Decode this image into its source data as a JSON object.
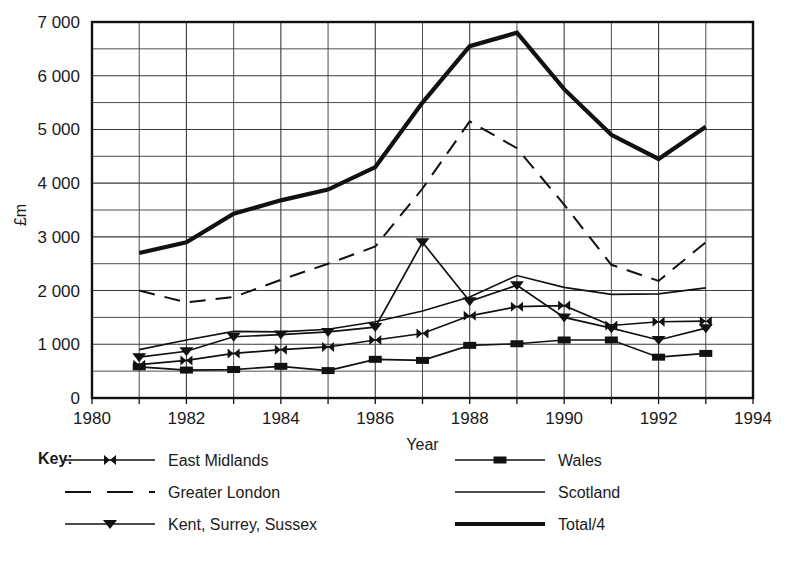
{
  "chart_data": {
    "type": "line",
    "title": "",
    "xlabel": "Year",
    "ylabel": "£m",
    "xlim": [
      1980,
      1994
    ],
    "ylim": [
      0,
      7000
    ],
    "xticks": [
      "1980",
      "1982",
      "1984",
      "1986",
      "1988",
      "1990",
      "1992",
      "1994"
    ],
    "xtick_values": [
      1980,
      1982,
      1984,
      1986,
      1988,
      1990,
      1992,
      1994
    ],
    "yticks": [
      "0",
      "1 000",
      "2 000",
      "3 000",
      "4 000",
      "5 000",
      "6 000",
      "7 000"
    ],
    "ytick_values": [
      0,
      1000,
      2000,
      3000,
      4000,
      5000,
      6000,
      7000
    ],
    "grid": "both",
    "grid_x_step": 1,
    "grid_y_step": 500,
    "legend_position": "below",
    "legend_title": "Key:",
    "x": [
      1981,
      1982,
      1983,
      1984,
      1985,
      1986,
      1987,
      1988,
      1989,
      1990,
      1991,
      1992,
      1993
    ],
    "series": [
      {
        "name": "East Midlands",
        "marker": "bowtie",
        "style": "solid-thin-marked",
        "values": [
          620,
          700,
          830,
          900,
          950,
          1080,
          1200,
          1530,
          1700,
          1720,
          1350,
          1420,
          1430
        ]
      },
      {
        "name": "Greater London",
        "marker": "none",
        "style": "dashed",
        "values": [
          2000,
          1780,
          1880,
          2200,
          2500,
          2820,
          3900,
          5150,
          4650,
          3600,
          2480,
          2180,
          2900
        ]
      },
      {
        "name": "Kent, Surrey, Sussex",
        "marker": "triangle-down",
        "style": "solid-thin-marked",
        "values": [
          760,
          870,
          1140,
          1180,
          1230,
          1320,
          2900,
          1800,
          2100,
          1500,
          1300,
          1080,
          1300
        ]
      },
      {
        "name": "Wales",
        "marker": "square",
        "style": "solid-thin-marked",
        "values": [
          580,
          520,
          530,
          590,
          510,
          720,
          700,
          980,
          1010,
          1080,
          1080,
          760,
          830
        ]
      },
      {
        "name": "Scotland",
        "marker": "none",
        "style": "solid-thin",
        "values": [
          900,
          1080,
          1240,
          1230,
          1280,
          1420,
          1620,
          1880,
          2280,
          2060,
          1930,
          1940,
          2050
        ]
      },
      {
        "name": "Total/4",
        "marker": "none",
        "style": "solid-thick",
        "values": [
          2700,
          2900,
          3430,
          3680,
          3880,
          4300,
          5500,
          6550,
          6800,
          5750,
          4900,
          4450,
          5050
        ]
      }
    ]
  },
  "legend": {
    "title": "Key:",
    "left_column": [
      "East Midlands",
      "Greater London",
      "Kent, Surrey, Sussex"
    ],
    "right_column": [
      "Wales",
      "Scotland",
      "Total/4"
    ]
  },
  "axes": {
    "x_title": "Year",
    "y_title": "£m"
  }
}
